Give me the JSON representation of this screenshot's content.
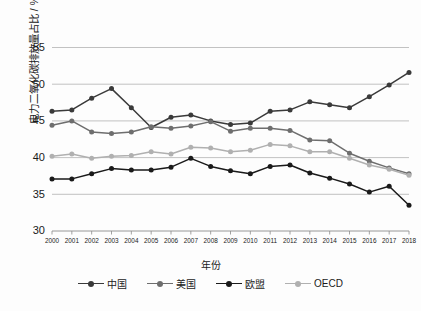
{
  "chart_data": {
    "type": "line",
    "title": "",
    "xlabel": "年份",
    "ylabel": "电力二氧化碳排放量占比 / %",
    "x": [
      2000,
      2001,
      2002,
      2003,
      2004,
      2005,
      2006,
      2007,
      2008,
      2009,
      2010,
      2011,
      2012,
      2013,
      2014,
      2015,
      2016,
      2017,
      2018
    ],
    "categories": [
      "2000",
      "2001",
      "2002",
      "2003",
      "2004",
      "2005",
      "2006",
      "2007",
      "2008",
      "2009",
      "2010",
      "2011",
      "2012",
      "2013",
      "2014",
      "2015",
      "2016",
      "2017",
      "2018"
    ],
    "xlim": [
      2000,
      2018
    ],
    "ylim": [
      30,
      55
    ],
    "yticks": [
      30,
      35,
      40,
      45,
      50,
      55
    ],
    "grid": true,
    "legend_position": "bottom",
    "series": [
      {
        "name": "中国",
        "color": "#3a3a3a",
        "values": [
          46.3,
          46.5,
          48.1,
          49.4,
          46.8,
          44.1,
          45.5,
          45.8,
          45.0,
          44.5,
          44.7,
          46.3,
          46.5,
          47.6,
          47.2,
          46.8,
          48.3,
          49.9,
          51.6
        ]
      },
      {
        "name": "美国",
        "color": "#6e6e6e",
        "values": [
          44.4,
          45.0,
          43.5,
          43.3,
          43.5,
          44.2,
          44.0,
          44.3,
          44.9,
          43.6,
          44.0,
          44.0,
          43.7,
          42.4,
          42.3,
          40.6,
          39.5,
          38.6,
          37.8
        ]
      },
      {
        "name": "欧盟",
        "color": "#1a1a1a",
        "values": [
          37.1,
          37.1,
          37.8,
          38.5,
          38.3,
          38.3,
          38.7,
          39.9,
          38.8,
          38.2,
          37.8,
          38.8,
          39.0,
          37.9,
          37.2,
          36.4,
          35.3,
          36.1,
          33.5
        ]
      },
      {
        "name": "OECD",
        "color": "#b0b0b0",
        "values": [
          40.2,
          40.5,
          39.9,
          40.2,
          40.3,
          40.8,
          40.5,
          41.4,
          41.3,
          40.8,
          41.0,
          41.8,
          41.6,
          40.8,
          40.8,
          39.9,
          39.0,
          38.4,
          37.6
        ]
      }
    ]
  },
  "axis": {
    "ytick_labels": [
      "55",
      "50",
      "45",
      "40",
      "35",
      "30"
    ],
    "xtick_labels": [
      "2000",
      "2001",
      "2002",
      "2003",
      "2004",
      "2005",
      "2006",
      "2007",
      "2008",
      "2009",
      "2010",
      "2011",
      "2012",
      "2013",
      "2014",
      "2015",
      "2016",
      "2017",
      "2018"
    ]
  },
  "legend": {
    "items": [
      {
        "label": "中国",
        "color": "#3a3a3a"
      },
      {
        "label": "美国",
        "color": "#6e6e6e"
      },
      {
        "label": "欧盟",
        "color": "#1a1a1a"
      },
      {
        "label": "OECD",
        "color": "#b0b0b0"
      }
    ]
  }
}
